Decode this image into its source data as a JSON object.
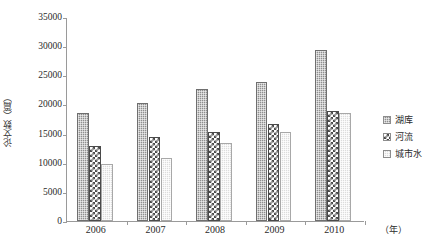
{
  "chart_data": {
    "type": "bar",
    "title": "",
    "subtitle": "",
    "xlabel": "（年）",
    "ylabel": "论文数（篇）",
    "categories": [
      "2006",
      "2007",
      "2008",
      "2009",
      "2010"
    ],
    "series": [
      {
        "name": "湖库",
        "values": [
          18500,
          20200,
          22600,
          23900,
          29300
        ],
        "swatch": "dark-dotted-swatch"
      },
      {
        "name": "河流",
        "values": [
          12900,
          14500,
          15200,
          16700,
          18900
        ],
        "swatch": "checkerboard-swatch"
      },
      {
        "name": "城市水",
        "values": [
          9700,
          10800,
          13400,
          15200,
          18500
        ],
        "swatch": "light-dotted-swatch"
      }
    ],
    "ylim": [
      0,
      35000
    ],
    "ytick_labels": [
      "0",
      "5000",
      "10000",
      "15000",
      "20000",
      "25000",
      "30000",
      "35000"
    ],
    "ytick_values": [
      0,
      5000,
      10000,
      15000,
      20000,
      25000,
      30000,
      35000
    ],
    "grid": false,
    "legend_position": "right",
    "colors": {
      "series1": "#8f8f8f",
      "series2": "#4a4a4a",
      "series3": "#dcdcdc",
      "axis": "#9a9a9a",
      "text": "#2b2b2b",
      "background": "#ffffff"
    }
  }
}
